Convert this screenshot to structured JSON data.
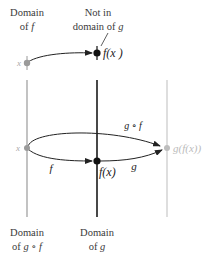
{
  "labels": {
    "domain_f_line1": "Domain",
    "domain_f_line2": "of ",
    "domain_f_var": "f",
    "not_in_line1": "Not in",
    "not_in_line2": "domain of ",
    "not_in_var": "g",
    "domain_gf_line1": "Domain",
    "domain_gf_line2": "of ",
    "domain_gf_var": "g ∘ f",
    "domain_g_line1": "Domain",
    "domain_g_line2": "of ",
    "domain_g_var": "g"
  },
  "points": {
    "top_x": "x",
    "top_fx": "f(x )",
    "mid_x": "x",
    "mid_fx": "f(x)",
    "mid_gfx": "g(f(x))"
  },
  "arrows": {
    "f": "f",
    "g": "g",
    "gf": "g ∘ f"
  },
  "colors": {
    "left_axis": "#9a9a9a",
    "middle_axis": "#1a1a1a",
    "right_axis": "#c8c8c8",
    "point_gray": "#9a9a9a",
    "point_black": "#111111",
    "point_light": "#bdbdbd"
  }
}
